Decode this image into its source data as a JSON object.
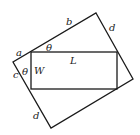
{
  "diagram": {
    "outer_rectangle": {
      "points": "96,13 133,79 51,128 13,62",
      "stroke": "#1a1a1a"
    },
    "inner_rectangle": {
      "x": 31,
      "y": 52,
      "width": 86,
      "height": 37,
      "stroke": "#1a1a1a"
    },
    "labels": {
      "a": "a",
      "b": "b",
      "c": "c",
      "d_top": "d",
      "d_bottom": "d",
      "L": "L",
      "W": "W",
      "theta_top": "θ",
      "theta_left": "θ"
    }
  }
}
